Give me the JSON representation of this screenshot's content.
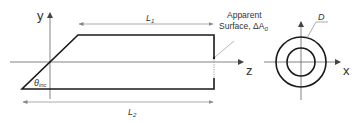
{
  "diagram": {
    "side_view": {
      "axis_y_label": "y",
      "axis_z_label": "z",
      "length_top_label": "L",
      "length_top_sub": "1",
      "length_bottom_label": "L",
      "length_bottom_sub": "2",
      "angle_label": "θ",
      "angle_sub": "inc",
      "annotation_line1": "Apparent",
      "annotation_line2": "Surface, ΔA",
      "annotation_sub": "0"
    },
    "end_view": {
      "diameter_label": "D",
      "axis_x_label": "x"
    },
    "colors": {
      "outline": "#1a1a1a",
      "axis": "#555555",
      "dimension": "#777777",
      "text": "#333333"
    }
  }
}
